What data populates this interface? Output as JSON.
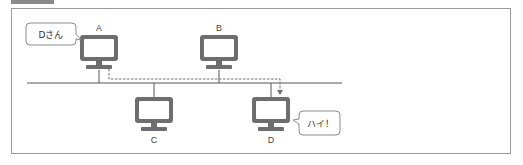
{
  "figure": {
    "type": "network-bus-diagram",
    "colors": {
      "monitor": "#6e6e6e",
      "screen": "#ffffff",
      "line": "#555555",
      "dashed": "#6e6e6e",
      "frame_border": "#9a9a9a",
      "bubble_border": "#8a8a8a"
    },
    "nodes": [
      {
        "id": "A",
        "label": "A"
      },
      {
        "id": "B",
        "label": "B"
      },
      {
        "id": "C",
        "label": "C"
      },
      {
        "id": "D",
        "label": "D"
      }
    ],
    "bubbles": [
      {
        "speaker": "A",
        "text": "Dさん"
      },
      {
        "speaker": "D",
        "text": "ハイ！"
      }
    ],
    "message_path": {
      "from": "A",
      "to": "D",
      "style": "dashed-arrow"
    }
  }
}
